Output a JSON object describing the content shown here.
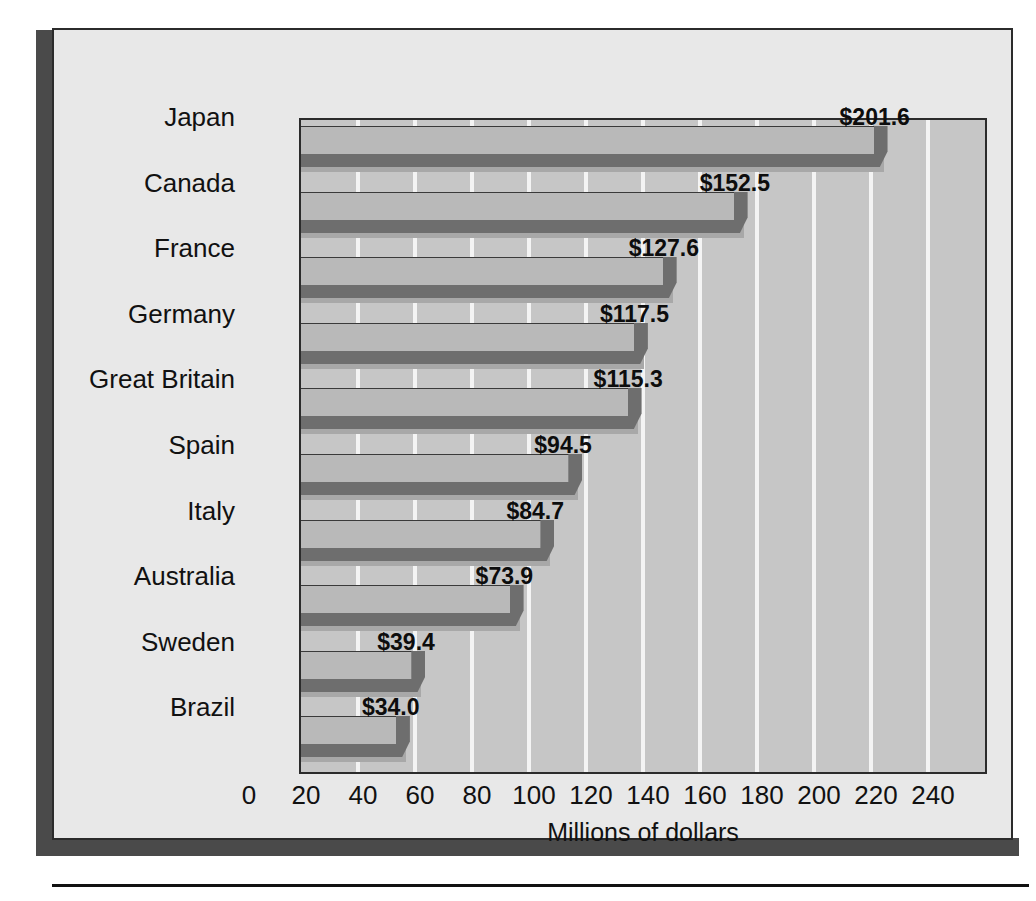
{
  "chart_data": {
    "type": "bar",
    "orientation": "horizontal",
    "title": "",
    "xlabel": "Millions of dollars",
    "ylabel": "",
    "xlim": [
      0,
      240
    ],
    "xticks": [
      0,
      20,
      40,
      60,
      80,
      100,
      120,
      140,
      160,
      180,
      200,
      220,
      240
    ],
    "xtick_labels": [
      "0",
      "20",
      "40",
      "60",
      "80",
      "100",
      "120",
      "140",
      "160",
      "180",
      "200",
      "220",
      "240"
    ],
    "grid": "vertical",
    "legend": "none",
    "categories": [
      "Japan",
      "Canada",
      "France",
      "Germany",
      "Great Britain",
      "Spain",
      "Italy",
      "Australia",
      "Sweden",
      "Brazil"
    ],
    "values": [
      201.6,
      152.5,
      127.6,
      117.5,
      115.3,
      94.5,
      84.7,
      73.9,
      39.4,
      34.0
    ],
    "value_labels": [
      "$201.6",
      "$152.5",
      "$127.6",
      "$117.5",
      "$115.3",
      "$94.5",
      "$84.7",
      "$73.9",
      "$39.4",
      "$34.0"
    ],
    "bars": [
      {
        "category": "Japan",
        "value": 201.6,
        "label": "$201.6"
      },
      {
        "category": "Canada",
        "value": 152.5,
        "label": "$152.5"
      },
      {
        "category": "France",
        "value": 127.6,
        "label": "$127.6"
      },
      {
        "category": "Germany",
        "value": 117.5,
        "label": "$117.5"
      },
      {
        "category": "Great Britain",
        "value": 115.3,
        "label": "$115.3"
      },
      {
        "category": "Spain",
        "value": 94.5,
        "label": "$94.5"
      },
      {
        "category": "Italy",
        "value": 84.7,
        "label": "$84.7"
      },
      {
        "category": "Australia",
        "value": 73.9,
        "label": "$73.9"
      },
      {
        "category": "Sweden",
        "value": 39.4,
        "label": "$39.4"
      },
      {
        "category": "Brazil",
        "value": 34.0,
        "label": "$34.0"
      }
    ],
    "colors": {
      "panel_background": "#e8e8e8",
      "plot_background": "#c6c6c6",
      "gridline": "#f4f4f4",
      "bar_top_face": "#b9b9b9",
      "bar_front_face": "#6e6e6e",
      "bar_shadow": "#a8a8a8",
      "frame": "#2b2b2b",
      "panel_shadow": "#4a4a4a",
      "text": "#111111"
    }
  }
}
